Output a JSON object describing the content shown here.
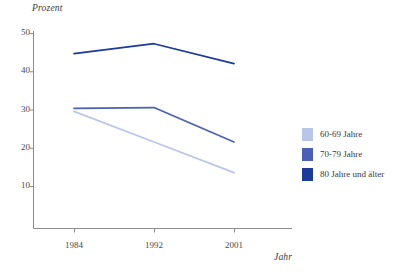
{
  "chart_data": {
    "type": "line",
    "title": "",
    "xlabel": "Jahr",
    "ylabel": "Prozent",
    "categories": [
      "1984",
      "1992",
      "2001"
    ],
    "x": [
      1984,
      1992,
      2001
    ],
    "ylim": [
      5,
      52
    ],
    "yticks": [
      10,
      20,
      30,
      40,
      50
    ],
    "xticks": [
      "1984",
      "1992",
      "2001"
    ],
    "grid": false,
    "legend_position": "right",
    "series": [
      {
        "name": "60-69 Jahre",
        "color": "#b9c6e8",
        "values": [
          29.5,
          21.5,
          13.5
        ]
      },
      {
        "name": "70-79 Jahre",
        "color": "#4a60b8",
        "values": [
          30.3,
          30.5,
          21.5
        ]
      },
      {
        "name": "80 Jahre und älter",
        "color": "#1a3a9c",
        "values": [
          44.6,
          47.2,
          42.0
        ]
      }
    ]
  },
  "axis": {
    "y_title": "Prozent",
    "x_title": "Jahr",
    "y_ticks": [
      {
        "label": "50",
        "value": 50
      },
      {
        "label": "40",
        "value": 40
      },
      {
        "label": "30",
        "value": 30
      },
      {
        "label": "20",
        "value": 20
      },
      {
        "label": "10",
        "value": 10
      }
    ],
    "x_ticks": [
      {
        "label": "1984",
        "value": 1984
      },
      {
        "label": "1992",
        "value": 1992
      },
      {
        "label": "2001",
        "value": 2001
      }
    ],
    "axis_color": "#8c8c8c"
  },
  "legend": {
    "items": [
      {
        "label": "60-69 Jahre",
        "color": "#b9c6e8"
      },
      {
        "label": "70-79 Jahre",
        "color": "#4a60b8"
      },
      {
        "label": "80 Jahre und älter",
        "color": "#1a3a9c"
      }
    ]
  }
}
